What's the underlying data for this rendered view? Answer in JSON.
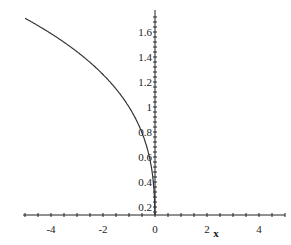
{
  "chart_data": {
    "type": "line",
    "title": "",
    "xlabel": "x",
    "ylabel": "",
    "xlim": [
      -5,
      5
    ],
    "ylim": [
      0.14,
      1.75
    ],
    "grid": false,
    "legend": null,
    "x_ticks": [
      "-4",
      "-2",
      "0",
      "2",
      "4"
    ],
    "y_ticks": [
      "0.2",
      "0.4",
      "0.6",
      "0.8",
      "1",
      "1.2",
      "1.4",
      "1.6"
    ],
    "series": [
      {
        "name": "y = (-x)^(1/3)",
        "x": [
          -5,
          -4.5,
          -4,
          -3.5,
          -3,
          -2.5,
          -2,
          -1.5,
          -1,
          -0.75,
          -0.5,
          -0.3,
          -0.2,
          -0.1,
          -0.05,
          -0.01,
          -0.003
        ],
        "y": [
          1.71,
          1.651,
          1.587,
          1.518,
          1.442,
          1.357,
          1.26,
          1.145,
          1.0,
          0.909,
          0.794,
          0.669,
          0.585,
          0.464,
          0.368,
          0.215,
          0.144
        ]
      }
    ]
  },
  "axes": {
    "x_label": "x",
    "x_tick_labels": [
      "-4",
      "-2",
      "0",
      "2",
      "4"
    ],
    "y_tick_labels": [
      "0.2",
      "0.4",
      "0.6",
      "0.8",
      "1",
      "1.2",
      "1.4",
      "1.6"
    ]
  },
  "colors": {
    "axis": "#222222",
    "curve": "#333333",
    "background": "#ffffff"
  }
}
